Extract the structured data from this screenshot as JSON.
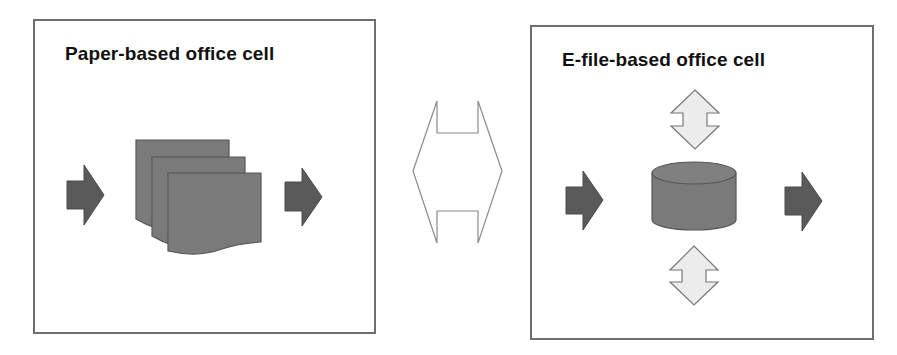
{
  "diagram": {
    "left_cell": {
      "title": "Paper-based office cell",
      "elements": [
        "input-arrow",
        "stacked-documents",
        "output-arrow"
      ]
    },
    "connector": {
      "type": "bidirectional-horizontal-arrow-outline"
    },
    "right_cell": {
      "title": "E-file-based office cell",
      "elements": [
        "input-arrow",
        "database-cylinder",
        "top-bidirectional-arrow",
        "bottom-bidirectional-arrow",
        "output-arrow"
      ]
    }
  },
  "colors": {
    "box_border": "#6e6e6e",
    "dark_arrow_fill": "#5a5a5a",
    "shape_fill": "#7a7a7a",
    "shape_stroke": "#555555",
    "light_arrow_fill": "#ececec",
    "light_arrow_stroke": "#777777",
    "connector_stroke": "#8a8a8a",
    "title_text": "#111111"
  }
}
